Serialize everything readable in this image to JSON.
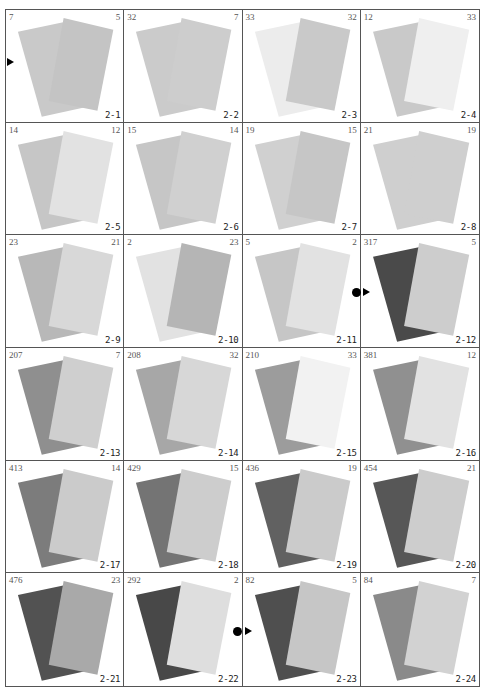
{
  "page": {
    "cells": [
      {
        "label": "2-1",
        "left": "7",
        "right": "5",
        "back": "#c9c9c9",
        "front": "#c4c4c4"
      },
      {
        "label": "2-2",
        "left": "32",
        "right": "7",
        "back": "#cbcbcb",
        "front": "#cdcdcd"
      },
      {
        "label": "2-3",
        "left": "33",
        "right": "32",
        "back": "#ececec",
        "front": "#c9c9c9"
      },
      {
        "label": "2-4",
        "left": "12",
        "right": "33",
        "back": "#c9c9c9",
        "front": "#efefef"
      },
      {
        "label": "2-5",
        "left": "14",
        "right": "12",
        "back": "#c6c6c6",
        "front": "#e2e2e2"
      },
      {
        "label": "2-6",
        "left": "15",
        "right": "14",
        "back": "#c6c6c6",
        "front": "#d0d0d0"
      },
      {
        "label": "2-7",
        "left": "19",
        "right": "15",
        "back": "#d0d0d0",
        "front": "#c6c6c6"
      },
      {
        "label": "2-8",
        "left": "21",
        "right": "19",
        "back": "#cfcfcf",
        "front": "#cfcfcf"
      },
      {
        "label": "2-9",
        "left": "23",
        "right": "21",
        "back": "#b8b8b8",
        "front": "#d8d8d8"
      },
      {
        "label": "2-10",
        "left": "2",
        "right": "23",
        "back": "#e2e2e2",
        "front": "#b5b5b5"
      },
      {
        "label": "2-11",
        "left": "5",
        "right": "2",
        "back": "#c6c6c6",
        "front": "#e2e2e2"
      },
      {
        "label": "2-12",
        "left": "317",
        "right": "5",
        "back": "#4a4a4a",
        "front": "#cdcdcd"
      },
      {
        "label": "2-13",
        "left": "207",
        "right": "7",
        "back": "#8f8f8f",
        "front": "#cfcfcf"
      },
      {
        "label": "2-14",
        "left": "208",
        "right": "32",
        "back": "#a7a7a7",
        "front": "#d7d7d7"
      },
      {
        "label": "2-15",
        "left": "210",
        "right": "33",
        "back": "#9c9c9c",
        "front": "#f2f2f2"
      },
      {
        "label": "2-16",
        "left": "381",
        "right": "12",
        "back": "#909090",
        "front": "#e2e2e2"
      },
      {
        "label": "2-17",
        "left": "413",
        "right": "14",
        "back": "#7c7c7c",
        "front": "#cbcbcb"
      },
      {
        "label": "2-18",
        "left": "429",
        "right": "15",
        "back": "#747474",
        "front": "#cdcdcd"
      },
      {
        "label": "2-19",
        "left": "436",
        "right": "19",
        "back": "#616161",
        "front": "#cbcbcb"
      },
      {
        "label": "2-20",
        "left": "454",
        "right": "21",
        "back": "#575757",
        "front": "#cdcdcd"
      },
      {
        "label": "2-21",
        "left": "476",
        "right": "23",
        "back": "#525252",
        "front": "#a9a9a9"
      },
      {
        "label": "2-22",
        "left": "292",
        "right": "2",
        "back": "#484848",
        "front": "#dedede"
      },
      {
        "label": "2-23",
        "left": "82",
        "right": "5",
        "back": "#4f4f4f",
        "front": "#c6c6c6"
      },
      {
        "label": "2-24",
        "left": "84",
        "right": "7",
        "back": "#8a8a8a",
        "front": "#d2d2d2"
      }
    ],
    "markers": [
      {
        "type": "triangle",
        "cell": "2-1",
        "x": 7,
        "y": 62
      },
      {
        "type": "dot",
        "cell": "2-12",
        "x": 352,
        "y": 292
      },
      {
        "type": "triangle",
        "cell": "2-12",
        "x": 363,
        "y": 292
      },
      {
        "type": "dot",
        "cell": "2-23",
        "x": 233,
        "y": 631
      },
      {
        "type": "triangle",
        "cell": "2-23",
        "x": 245,
        "y": 631
      }
    ]
  }
}
